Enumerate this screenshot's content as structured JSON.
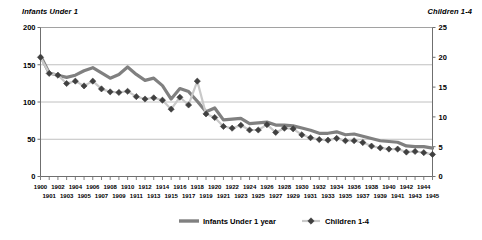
{
  "chart_data": {
    "type": "line",
    "title": "",
    "xlabel": "",
    "ylabel": "Infants Under 1",
    "y2label": "Children 1-4",
    "ylim": [
      0,
      200
    ],
    "y2lim": [
      0,
      25
    ],
    "yticks": [
      0,
      50,
      100,
      150,
      200
    ],
    "y2ticks": [
      0,
      5,
      10,
      15,
      20,
      25
    ],
    "grid": true,
    "legend_position": "bottom",
    "x": [
      1900,
      1901,
      1902,
      1903,
      1904,
      1905,
      1906,
      1907,
      1908,
      1909,
      1910,
      1911,
      1912,
      1913,
      1914,
      1915,
      1916,
      1917,
      1918,
      1919,
      1920,
      1921,
      1922,
      1923,
      1924,
      1925,
      1926,
      1927,
      1928,
      1929,
      1930,
      1931,
      1932,
      1933,
      1934,
      1935,
      1936,
      1937,
      1938,
      1939,
      1940,
      1941,
      1942,
      1943,
      1944,
      1945
    ],
    "xticks_row_even": [
      "1900",
      "1902",
      "1904",
      "1906",
      "1908",
      "1910",
      "1912",
      "1914",
      "1916",
      "1918",
      "1920",
      "1922",
      "1924",
      "1926",
      "1928",
      "1930",
      "1932",
      "1934",
      "1936",
      "1938",
      "1940",
      "1942",
      "1944"
    ],
    "xticks_row_odd": [
      "1901",
      "1903",
      "1905",
      "1907",
      "1909",
      "1911",
      "1913",
      "1915",
      "1917",
      "1919",
      "1921",
      "1923",
      "1925",
      "1927",
      "1929",
      "1931",
      "1933",
      "1935",
      "1937",
      "1939",
      "1941",
      "1943",
      "1945"
    ],
    "series": [
      {
        "name": "Infants Under 1 year",
        "axis": "left",
        "color": "#808080",
        "style": "thick-line",
        "values": [
          162,
          139,
          136,
          133,
          136,
          142,
          146,
          139,
          132,
          137,
          147,
          137,
          129,
          132,
          122,
          104,
          118,
          114,
          101,
          87,
          92,
          76,
          77,
          78,
          71,
          72,
          73,
          69,
          69,
          68,
          65,
          62,
          58,
          58,
          60,
          56,
          57,
          54,
          51,
          48,
          47,
          46,
          41,
          40,
          40,
          38
        ]
      },
      {
        "name": "Children 1-4",
        "axis": "right",
        "color": "#404040",
        "style": "line-with-diamond-markers",
        "values": [
          20.0,
          17.3,
          17.0,
          15.6,
          16.0,
          15.2,
          16.0,
          14.7,
          14.2,
          14.1,
          14.3,
          13.4,
          13.0,
          13.2,
          12.8,
          11.3,
          13.3,
          12.0,
          16.0,
          10.5,
          9.9,
          8.4,
          8.1,
          8.6,
          7.8,
          7.8,
          8.7,
          7.4,
          8.1,
          8.0,
          7.0,
          6.5,
          6.2,
          6.1,
          6.4,
          6.0,
          6.0,
          5.7,
          5.1,
          4.8,
          4.6,
          4.6,
          4.1,
          4.2,
          4.0,
          3.7
        ]
      }
    ]
  },
  "legend": {
    "items": [
      {
        "label": "Infants Under 1 year",
        "marker": "thick-line",
        "color": "#808080"
      },
      {
        "label": "Children 1-4",
        "marker": "diamond",
        "color": "#404040"
      }
    ]
  },
  "axis_titles": {
    "left": "Infants Under 1",
    "right": "Children 1-4"
  }
}
